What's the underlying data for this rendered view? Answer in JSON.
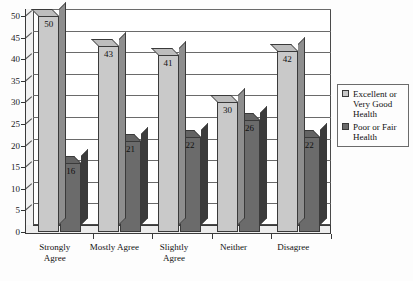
{
  "chart_data": {
    "type": "bar",
    "title": "",
    "subtitle": "",
    "xlabel": "",
    "ylabel": "",
    "ylim": [
      0,
      50
    ],
    "yticks": [
      0,
      5,
      10,
      15,
      20,
      25,
      30,
      35,
      40,
      45,
      50
    ],
    "grid": true,
    "legend_position": "right",
    "style": "3d-column",
    "categories": [
      "Strongly Agree",
      "Mostly Agree",
      "Slightly Agree",
      "Neither",
      "Disagree"
    ],
    "category_lines": [
      [
        "Strongly",
        "Agree"
      ],
      [
        "Mostly Agree"
      ],
      [
        "Slightly",
        "Agree"
      ],
      [
        "Neither"
      ],
      [
        "Disagree"
      ]
    ],
    "series": [
      {
        "name": "Excellent or Very Good Health",
        "name_lines": [
          "Excellent or",
          "Very Good",
          "Health"
        ],
        "color": "#c9c9c9",
        "values": [
          50,
          43,
          41,
          30,
          42
        ]
      },
      {
        "name": "Poor or Fair Health",
        "name_lines": [
          "Poor or Fair",
          "Health"
        ],
        "color": "#6b6b6b",
        "values": [
          16,
          21,
          22,
          26,
          22
        ]
      }
    ]
  },
  "legend": {
    "items": [
      {
        "label_lines": [
          "Excellent or",
          "Very Good",
          "Health"
        ],
        "swatch": "light"
      },
      {
        "label_lines": [
          "Poor or Fair",
          "Health"
        ],
        "swatch": "dark"
      }
    ]
  }
}
